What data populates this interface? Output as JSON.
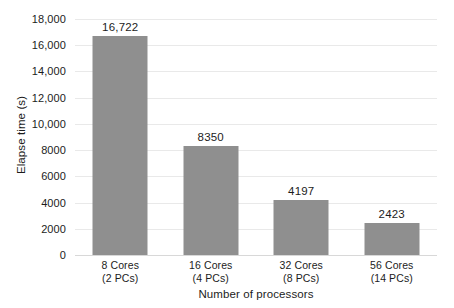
{
  "chart_data": {
    "type": "bar",
    "title": "",
    "subtitle": "",
    "xlabel": "Number of processors",
    "ylabel": "Elapse time (s)",
    "categories": [
      "8 Cores\n(2 PCs)",
      "16 Cores\n(4 PCs)",
      "32 Cores\n(8 PCs)",
      "56 Cores\n(14 PCs)"
    ],
    "category_lines": [
      [
        "8 Cores",
        "(2 PCs)"
      ],
      [
        "16 Cores",
        "(4 PCs)"
      ],
      [
        "32 Cores",
        "(8 PCs)"
      ],
      [
        "56 Cores",
        "(14 PCs)"
      ]
    ],
    "values": [
      16722,
      8350,
      4197,
      2423
    ],
    "value_labels": [
      "16,722",
      "8350",
      "4197",
      "2423"
    ],
    "ylim": [
      0,
      18000
    ],
    "ytick_values": [
      18000,
      16000,
      14000,
      12000,
      10000,
      8000,
      6000,
      4000,
      2000,
      0
    ],
    "ytick_labels": [
      "18,000",
      "16,000",
      "14,000",
      "12,000",
      "10,000",
      "8000",
      "6000",
      "4000",
      "2000",
      "0"
    ],
    "grid": true,
    "grid_axis": "y",
    "legend": false,
    "legend_position": "none",
    "bar_color": "#8f8f8f",
    "gridline_color": "#e9e9e9",
    "background_color": "#ffffff",
    "text_color": "#1c1c1c"
  }
}
